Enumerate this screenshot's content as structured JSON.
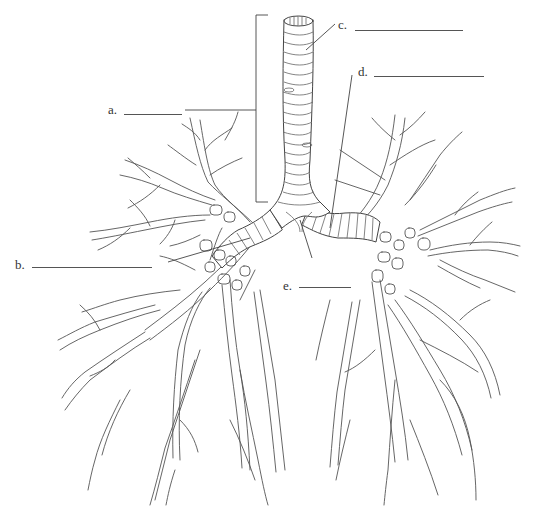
{
  "diagram": {
    "style": "black-and-white line art worksheet",
    "colors": {
      "background": "#ffffff",
      "ink": "#444444"
    },
    "labels": [
      {
        "id": "a",
        "text": "a.",
        "blank": "",
        "points_to": "bracket along trachea"
      },
      {
        "id": "b",
        "text": "b.",
        "blank": "",
        "points_to": "left-side bronchus"
      },
      {
        "id": "c",
        "text": "c.",
        "blank": "",
        "points_to": "upper trachea"
      },
      {
        "id": "d",
        "text": "d.",
        "blank": "",
        "points_to": "right primary bronchus"
      },
      {
        "id": "e",
        "text": "e.",
        "blank": "",
        "points_to": "carina / bifurcation"
      }
    ]
  }
}
